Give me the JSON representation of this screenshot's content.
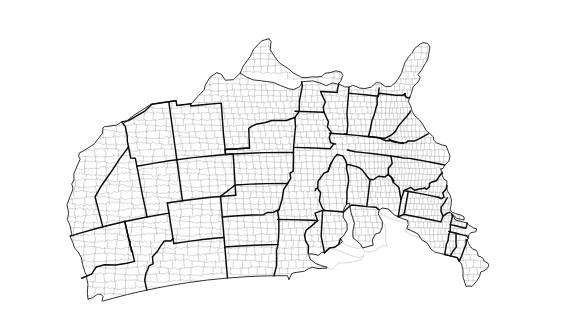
{
  "figure": {
    "kind": "map",
    "title": "",
    "subtitle": "",
    "caption": "",
    "background_color": "#ffffff",
    "width": 567,
    "height": 333
  },
  "map": {
    "name": "united-states-county-map",
    "region": "Contiguous United States (lower 48)",
    "projection": "Albers Equal Area Conic",
    "projection_parameters": {
      "standard_parallel_1": 29.5,
      "standard_parallel_2": 45.5,
      "central_meridian": -96,
      "latitude_of_origin": 37.5
    },
    "bounds_lonlat": {
      "west": -124.8,
      "east": -66.9,
      "south": 24.4,
      "north": 49.4
    },
    "layers": [
      {
        "name": "counties",
        "label": "County boundaries",
        "stroke_color": "#8c8c8c",
        "stroke_width": 0.35,
        "fill_color": "#ffffff",
        "visible": true
      },
      {
        "name": "states",
        "label": "State boundaries",
        "stroke_color": "#0a0a0a",
        "stroke_width": 1.45,
        "fill_color": "none",
        "visible": true
      },
      {
        "name": "nation",
        "label": "National outline / coastline",
        "stroke_color": "#1a1a1a",
        "stroke_width": 0.9,
        "fill_color": "none",
        "visible": true
      },
      {
        "name": "lakes",
        "label": "Great Lakes",
        "stroke_color": "#9a9a9a",
        "stroke_width": 0.4,
        "fill_color": "#ffffff",
        "visible": true
      }
    ],
    "legend": {
      "visible": false,
      "items": []
    },
    "scale_bar": {
      "visible": false,
      "label": ""
    },
    "north_arrow": {
      "visible": false
    },
    "graticule": {
      "visible": false
    },
    "labels": {
      "state_names": false,
      "county_names": false,
      "city_names": false
    },
    "counties_total": 3108,
    "states_total": 49,
    "states": [
      "Alabama",
      "Arizona",
      "Arkansas",
      "California",
      "Colorado",
      "Connecticut",
      "Delaware",
      "District of Columbia",
      "Florida",
      "Georgia",
      "Idaho",
      "Illinois",
      "Indiana",
      "Iowa",
      "Kansas",
      "Kentucky",
      "Louisiana",
      "Maine",
      "Maryland",
      "Massachusetts",
      "Michigan",
      "Minnesota",
      "Mississippi",
      "Missouri",
      "Montana",
      "Nebraska",
      "Nevada",
      "New Hampshire",
      "New Jersey",
      "New Mexico",
      "New York",
      "North Carolina",
      "North Dakota",
      "Ohio",
      "Oklahoma",
      "Oregon",
      "Pennsylvania",
      "Rhode Island",
      "South Carolina",
      "South Dakota",
      "Tennessee",
      "Texas",
      "Utah",
      "Vermont",
      "Virginia",
      "Washington",
      "West Virginia",
      "Wisconsin",
      "Wyoming"
    ],
    "great_lakes": [
      "Superior",
      "Michigan",
      "Huron",
      "Erie",
      "Ontario"
    ]
  }
}
